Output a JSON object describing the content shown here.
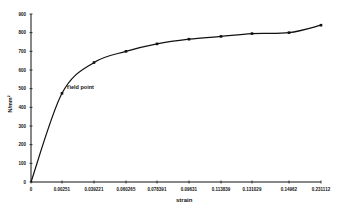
{
  "chart_data": {
    "type": "line",
    "title": "",
    "xlabel": "strain",
    "ylabel": "N/mm²",
    "ylim": [
      0,
      900
    ],
    "yticks": [
      0,
      100,
      200,
      300,
      400,
      500,
      600,
      700,
      800,
      900
    ],
    "categories": [
      "0",
      "0.00251",
      "0.039221",
      "0.060265",
      "0.078391",
      "0.09631",
      "0.113839",
      "0.131029",
      "0.14962",
      "0.231112"
    ],
    "series": [
      {
        "name": "stress",
        "values": [
          0,
          475,
          640,
          700,
          740,
          765,
          780,
          795,
          800,
          840
        ]
      }
    ],
    "annotations": [
      {
        "text": "Yield point",
        "category_index": 1
      }
    ],
    "grid": false,
    "legend": "none"
  }
}
